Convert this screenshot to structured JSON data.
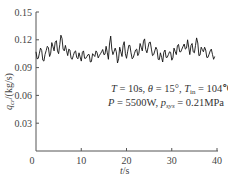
{
  "chart_data": {
    "type": "line",
    "title": "",
    "xlabel": "t/s",
    "ylabel": "q_cr/(kg/s)",
    "xlim": [
      0,
      40
    ],
    "ylim": [
      0,
      0.15
    ],
    "xticks": [
      "0",
      "10",
      "20",
      "30",
      "40"
    ],
    "yticks": [
      "0.03",
      "0.06",
      "0.09",
      "0.12",
      "0.15"
    ],
    "grid": false,
    "legend": null,
    "annotation": {
      "line1": "T = 10s, θ = 15°, T_in = 104℃",
      "line2": "P = 5500W, p_sys = 0.21MPa"
    },
    "series": [
      {
        "name": "q_cr",
        "color": "#111111",
        "x": [
          0.0,
          0.5,
          1.0,
          1.5,
          2.0,
          2.5,
          3.0,
          3.5,
          4.0,
          4.5,
          5.0,
          5.5,
          6.0,
          6.5,
          7.0,
          7.5,
          8.0,
          8.5,
          9.0,
          9.5,
          10.0,
          10.5,
          11.0,
          11.5,
          12.0,
          12.5,
          13.0,
          13.5,
          14.0,
          14.5,
          15.0,
          15.5,
          16.0,
          16.5,
          17.0,
          17.5,
          18.0,
          18.5,
          19.0,
          19.5,
          20.0,
          20.5,
          21.0,
          21.5,
          22.0,
          22.5,
          23.0,
          23.5,
          24.0,
          24.5,
          25.0,
          25.5,
          26.0,
          26.5,
          27.0,
          27.5,
          28.0,
          28.5,
          29.0,
          29.5,
          30.0,
          30.5,
          31.0,
          31.5,
          32.0,
          32.5,
          33.0,
          33.5,
          34.0,
          34.5,
          35.0,
          35.5,
          36.0,
          36.5,
          37.0,
          37.5,
          38.0,
          38.5,
          39.0,
          39.5
        ],
        "values": [
          0.107,
          0.1,
          0.111,
          0.098,
          0.104,
          0.113,
          0.102,
          0.117,
          0.108,
          0.119,
          0.105,
          0.125,
          0.11,
          0.114,
          0.103,
          0.109,
          0.099,
          0.107,
          0.101,
          0.106,
          0.097,
          0.108,
          0.1,
          0.104,
          0.096,
          0.105,
          0.102,
          0.106,
          0.103,
          0.107,
          0.104,
          0.113,
          0.099,
          0.124,
          0.104,
          0.111,
          0.095,
          0.112,
          0.102,
          0.118,
          0.1,
          0.114,
          0.106,
          0.101,
          0.109,
          0.103,
          0.116,
          0.108,
          0.121,
          0.106,
          0.117,
          0.11,
          0.104,
          0.112,
          0.099,
          0.106,
          0.096,
          0.109,
          0.101,
          0.107,
          0.098,
          0.111,
          0.104,
          0.115,
          0.107,
          0.113,
          0.11,
          0.12,
          0.104,
          0.116,
          0.106,
          0.122,
          0.103,
          0.112,
          0.107,
          0.109,
          0.101,
          0.108,
          0.104,
          0.102
        ]
      }
    ]
  }
}
